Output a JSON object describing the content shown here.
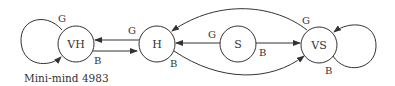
{
  "diagram": {
    "caption": "Mini-mind 4983",
    "nodes": [
      {
        "id": "VH",
        "label": "VH"
      },
      {
        "id": "H",
        "label": "H"
      },
      {
        "id": "S",
        "label": "S"
      },
      {
        "id": "VS",
        "label": "VS"
      }
    ],
    "edges": [
      {
        "from": "VH",
        "to": "VH",
        "label": "G"
      },
      {
        "from": "VH",
        "to": "H",
        "label": "B"
      },
      {
        "from": "H",
        "to": "VH",
        "label": "G"
      },
      {
        "from": "H",
        "to": "VS",
        "label": "B"
      },
      {
        "from": "S",
        "to": "H",
        "label": "G"
      },
      {
        "from": "S",
        "to": "VS",
        "label": "B"
      },
      {
        "from": "VS",
        "to": "H",
        "label": "G"
      },
      {
        "from": "VS",
        "to": "VS",
        "label": "B"
      }
    ],
    "colors": {
      "stroke": "#333333",
      "background": "#ffffff"
    }
  }
}
